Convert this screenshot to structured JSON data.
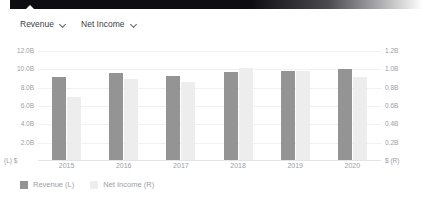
{
  "selectors": [
    {
      "label": "Revenue",
      "icon": "chevron-down-icon"
    },
    {
      "label": "Net Income",
      "icon": "chevron-down-icon"
    }
  ],
  "axis": {
    "left_unit": "(L)  $",
    "right_unit": "$   (R)"
  },
  "legend": [
    {
      "label": "Revenue (L)",
      "color": "#949494"
    },
    {
      "label": "Net Income (R)",
      "color": "#ededed"
    }
  ],
  "chart_data": {
    "type": "bar",
    "title": "",
    "xlabel": "",
    "ylabel": "",
    "grid": true,
    "legend_position": "bottom-left",
    "categories": [
      "2015",
      "2016",
      "2017",
      "2018",
      "2019",
      "2020"
    ],
    "series": [
      {
        "name": "Revenue (L)",
        "axis": "left",
        "color": "#949494",
        "values": [
          9.2,
          9.6,
          9.3,
          9.75,
          9.8,
          10.0
        ],
        "unit": "B"
      },
      {
        "name": "Net Income (R)",
        "axis": "right",
        "color": "#ededed",
        "values": [
          0.7,
          0.9,
          0.86,
          1.02,
          0.98,
          0.92
        ],
        "unit": "B"
      }
    ],
    "left_axis": {
      "ticks": [
        "12.0B",
        "10.0B",
        "8.0B",
        "6.0B",
        "4.0B",
        "2.0B"
      ],
      "values": [
        12,
        10,
        8,
        6,
        4,
        2
      ],
      "ylim": [
        0,
        12
      ]
    },
    "right_axis": {
      "ticks": [
        "1.2B",
        "1.0B",
        "0.8B",
        "0.6B",
        "0.4B",
        "0.2B"
      ],
      "values": [
        1.2,
        1.0,
        0.8,
        0.6,
        0.4,
        0.2
      ],
      "ylim": [
        0,
        1.2
      ]
    }
  }
}
